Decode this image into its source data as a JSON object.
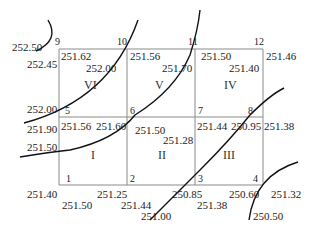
{
  "grid": {
    "left": 59,
    "top": 49,
    "right": 263,
    "bottom": 185,
    "cols": [
      59,
      127,
      195,
      263
    ],
    "rows": [
      49,
      117,
      185
    ],
    "line_color": "#8a8a8a"
  },
  "corner_numbers": [
    {
      "id": "9",
      "x": 55,
      "y": 37
    },
    {
      "id": "10",
      "x": 117,
      "y": 37
    },
    {
      "id": "11",
      "x": 188,
      "y": 37
    },
    {
      "id": "12",
      "x": 254,
      "y": 37
    },
    {
      "id": "5",
      "x": 65,
      "y": 106
    },
    {
      "id": "6",
      "x": 130,
      "y": 106
    },
    {
      "id": "7",
      "x": 198,
      "y": 106
    },
    {
      "id": "8",
      "x": 248,
      "y": 106
    },
    {
      "id": "1",
      "x": 66,
      "y": 174
    },
    {
      "id": "2",
      "x": 130,
      "y": 174
    },
    {
      "id": "3",
      "x": 198,
      "y": 174
    },
    {
      "id": "4",
      "x": 253,
      "y": 174
    }
  ],
  "region_labels": [
    {
      "id": "VI",
      "x": 84,
      "y": 79
    },
    {
      "id": "V",
      "x": 155,
      "y": 79
    },
    {
      "id": "IV",
      "x": 224,
      "y": 79
    },
    {
      "id": "I",
      "x": 91,
      "y": 149
    },
    {
      "id": "II",
      "x": 158,
      "y": 149
    },
    {
      "id": "III",
      "x": 223,
      "y": 149
    }
  ],
  "elevations": [
    {
      "text": "252.50",
      "x": 12,
      "y": 42
    },
    {
      "text": "252.45",
      "x": 27,
      "y": 59
    },
    {
      "text": "251.62",
      "x": 61,
      "y": 51
    },
    {
      "text": "252.00",
      "x": 86,
      "y": 63
    },
    {
      "text": "251.56",
      "x": 130,
      "y": 51
    },
    {
      "text": "251.70",
      "x": 162,
      "y": 63
    },
    {
      "text": "251.50",
      "x": 201,
      "y": 51
    },
    {
      "text": "251.40",
      "x": 229,
      "y": 63
    },
    {
      "text": "251.46",
      "x": 266,
      "y": 51
    },
    {
      "text": "252.00",
      "x": 27,
      "y": 104
    },
    {
      "text": "251.90",
      "x": 27,
      "y": 124
    },
    {
      "text": "251.56",
      "x": 61,
      "y": 121
    },
    {
      "text": "251.60",
      "x": 96,
      "y": 121
    },
    {
      "text": "251.50",
      "x": 135,
      "y": 125
    },
    {
      "text": "251.28",
      "x": 163,
      "y": 135
    },
    {
      "text": "251.44",
      "x": 197,
      "y": 121
    },
    {
      "text": "250.95",
      "x": 231,
      "y": 121
    },
    {
      "text": "251.38",
      "x": 264,
      "y": 121
    },
    {
      "text": "251.50",
      "x": 27,
      "y": 142
    },
    {
      "text": "251.40",
      "x": 27,
      "y": 189
    },
    {
      "text": "251.25",
      "x": 97,
      "y": 189
    },
    {
      "text": "251.50",
      "x": 62,
      "y": 200
    },
    {
      "text": "251.44",
      "x": 121,
      "y": 200
    },
    {
      "text": "250.85",
      "x": 172,
      "y": 189
    },
    {
      "text": "251.00",
      "x": 141,
      "y": 211
    },
    {
      "text": "251.38",
      "x": 197,
      "y": 200
    },
    {
      "text": "250.60",
      "x": 229,
      "y": 189
    },
    {
      "text": "251.32",
      "x": 271,
      "y": 189
    },
    {
      "text": "250.50",
      "x": 253,
      "y": 211
    }
  ],
  "contours": [
    {
      "name": "contour-252.50",
      "d": "M 48 20 Q 60 40 36 51"
    },
    {
      "name": "contour-252.00",
      "d": "M 24 123 Q 110 100 138 20"
    },
    {
      "name": "contour-251.50",
      "d": "M 20 157 Q 50 152 70 150 Q 115 140 135 115 Q 175 90 190 55 Q 198 30 200 10"
    },
    {
      "name": "contour-251.00",
      "d": "M 150 220 Q 175 195 200 170 Q 230 140 250 115 Q 270 95 284 88"
    },
    {
      "name": "contour-250.50",
      "d": "M 249 220 Q 255 175 298 162"
    }
  ]
}
